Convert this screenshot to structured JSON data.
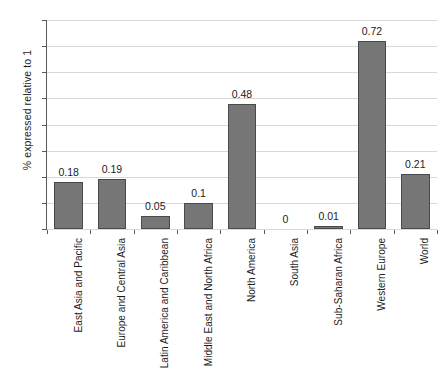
{
  "chart_data": {
    "type": "bar",
    "title": "",
    "subtitle": "",
    "xlabel": "",
    "ylabel": "% expressed relative to 1",
    "categories": [
      "East Asia and Pacific",
      "Europe and Central Asia",
      "Latin America and Caribbean",
      "Middle East and North Africa",
      "North America",
      "South Asia",
      "Sub-Saharan Africa",
      "Western Europe",
      "World"
    ],
    "values": [
      0.18,
      0.19,
      0.05,
      0.1,
      0.48,
      0,
      0.01,
      0.72,
      0.21
    ],
    "value_labels": [
      "0.18",
      "0.19",
      "0.05",
      "0.1",
      "0.48",
      "0",
      "0.01",
      "0.72",
      "0.21"
    ],
    "ylim": [
      0,
      0.8
    ],
    "yticks": [
      0,
      0.1,
      0.2,
      0.3,
      0.4,
      0.5,
      0.6,
      0.7,
      0.8
    ],
    "ytick_labels": [
      "0",
      "0.1",
      "0.2",
      "0.3",
      "0.4",
      "0.5",
      "0.6",
      "0.7",
      "0.8"
    ],
    "grid": "horizontal",
    "legend": "none",
    "bar_color": "#767676",
    "bar_edge_color": "#4a4a4a",
    "grid_color": "#d8d8d8",
    "axis_color": "#5a5a5a",
    "background": "#ffffff"
  }
}
